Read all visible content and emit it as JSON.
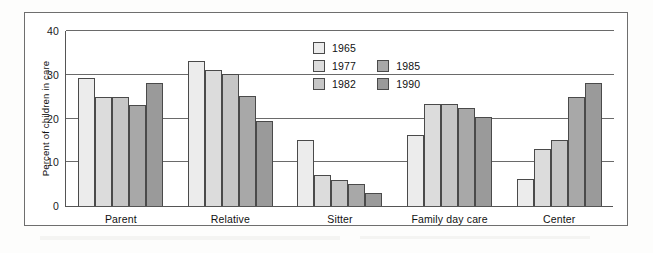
{
  "chart_data": {
    "type": "bar",
    "title": "",
    "xlabel": "",
    "ylabel": "Percent of children in care",
    "ylim": [
      0,
      40
    ],
    "yticks": [
      0,
      10,
      20,
      30,
      40
    ],
    "grid": true,
    "legend_position": "upper-center",
    "categories": [
      "Parent",
      "Relative",
      "Sitter",
      "Family day care",
      "Center"
    ],
    "series": [
      {
        "name": "1965",
        "color": "#ececec",
        "values": [
          29.3,
          33.1,
          15.2,
          16.2,
          6.1
        ]
      },
      {
        "name": "1977",
        "color": "#dcdcdc",
        "values": [
          25.0,
          31.0,
          7.0,
          23.3,
          13.1
        ]
      },
      {
        "name": "1982",
        "color": "#c6c6c6",
        "values": [
          25.0,
          30.2,
          6.0,
          23.3,
          15.2
        ]
      },
      {
        "name": "1985",
        "color": "#a8a8a8",
        "values": [
          23.0,
          25.2,
          5.0,
          22.3,
          25.0
        ]
      },
      {
        "name": "1990",
        "color": "#9a9a9a",
        "values": [
          28.1,
          19.4,
          3.0,
          20.3,
          28.1
        ]
      }
    ]
  },
  "legend": {
    "column_one": [
      "1965",
      "1977",
      "1982"
    ],
    "column_two": [
      "1985",
      "1990"
    ]
  },
  "axis": {
    "y_title": "Percent of children in care",
    "y_tick_labels": [
      "40",
      "30",
      "20",
      "10",
      "0"
    ],
    "x_tick_labels": [
      "Parent",
      "Relative",
      "Sitter",
      "Family day care",
      "Center"
    ]
  },
  "colors": {
    "series_1965": "#ececec",
    "series_1977": "#dcdcdc",
    "series_1982": "#c6c6c6",
    "series_1985": "#a8a8a8",
    "series_1990": "#9a9a9a",
    "axis": "#555555",
    "grid": "#6a6a6a",
    "frame": "#6e6e6e",
    "text": "#111111",
    "background": "#ffffff"
  }
}
